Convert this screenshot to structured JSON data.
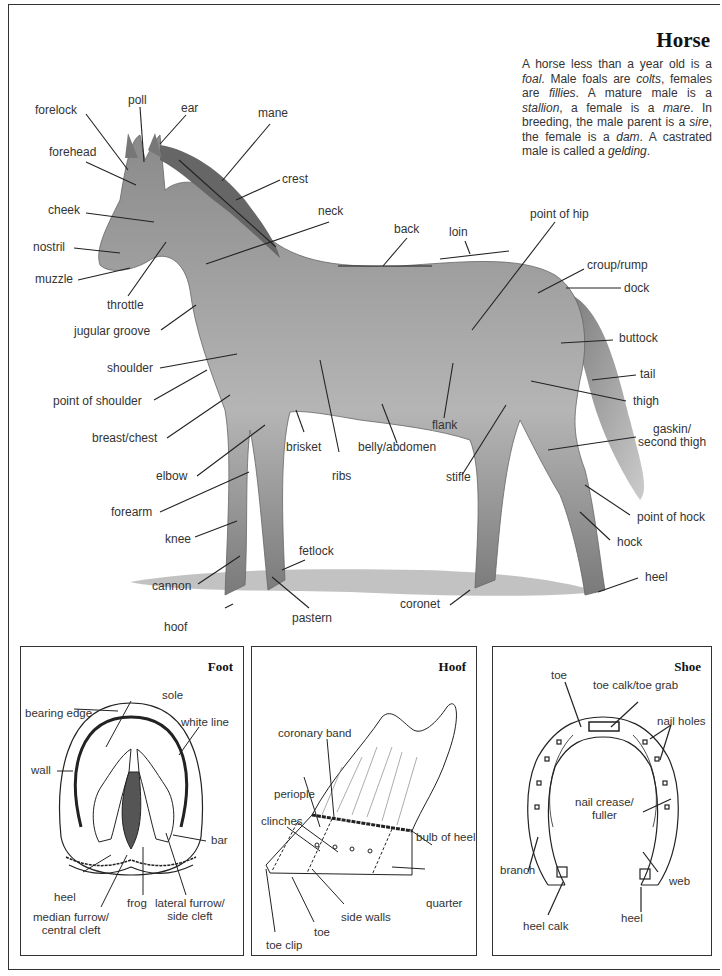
{
  "header": {
    "title": "Horse",
    "intro": [
      {
        "text": "A horse less than a year old is a "
      },
      {
        "text": "foal",
        "italic": true
      },
      {
        "text": ". Male foals are "
      },
      {
        "text": "colts",
        "italic": true
      },
      {
        "text": ", females are "
      },
      {
        "text": "fillies",
        "italic": true
      },
      {
        "text": ". A mature male is a "
      },
      {
        "text": "stallion",
        "italic": true
      },
      {
        "text": ", a female is a "
      },
      {
        "text": "mare",
        "italic": true
      },
      {
        "text": ". In breeding, the male parent is a "
      },
      {
        "text": "sire",
        "italic": true
      },
      {
        "text": ", the female is a "
      },
      {
        "text": "dam",
        "italic": true
      },
      {
        "text": ". A castrated male is called a "
      },
      {
        "text": "gelding",
        "italic": true
      },
      {
        "text": "."
      }
    ]
  },
  "horse_labels": {
    "poll": "poll",
    "forelock": "forelock",
    "ear": "ear",
    "mane": "mane",
    "forehead": "forehead",
    "crest": "crest",
    "cheek": "cheek",
    "neck": "neck",
    "nostril": "nostril",
    "muzzle": "muzzle",
    "throttle": "throttle",
    "jugular_groove": "jugular groove",
    "back": "back",
    "loin": "loin",
    "point_of_hip": "point of hip",
    "croup_rump": "croup/rump",
    "dock": "dock",
    "buttock": "buttock",
    "tail": "tail",
    "thigh": "thigh",
    "gaskin_1": "gaskin/",
    "gaskin_2": "second thigh",
    "shoulder": "shoulder",
    "point_of_shoulder": "point of shoulder",
    "breast_chest": "breast/chest",
    "elbow": "elbow",
    "brisket": "brisket",
    "ribs": "ribs",
    "belly_abdomen": "belly/abdomen",
    "flank": "flank",
    "stifle": "stifle",
    "forearm": "forearm",
    "knee": "knee",
    "fetlock": "fetlock",
    "cannon": "cannon",
    "pastern": "pastern",
    "hoof": "hoof",
    "coronet": "coronet",
    "point_of_hock": "point of hock",
    "hock": "hock",
    "heel": "heel"
  },
  "foot_panel": {
    "title": "Foot",
    "labels": {
      "sole": "sole",
      "bearing_edge": "bearing edge",
      "white_line": "white line",
      "wall": "wall",
      "bar": "bar",
      "heel": "heel",
      "frog": "frog",
      "median_furrow_1": "median furrow/",
      "median_furrow_2": "central cleft",
      "lateral_furrow_1": "lateral furrow/",
      "lateral_furrow_2": "side cleft"
    }
  },
  "hoof_panel": {
    "title": "Hoof",
    "labels": {
      "coronary_band": "coronary band",
      "periople": "periople",
      "clinches": "clinches",
      "bulb_of_heel": "bulb of heel",
      "quarter": "quarter",
      "side_walls": "side walls",
      "toe": "toe",
      "toe_clip": "toe clip"
    }
  },
  "shoe_panel": {
    "title": "Shoe",
    "labels": {
      "toe": "toe",
      "toe_calk": "toe calk/toe grab",
      "nail_holes": "nail holes",
      "nail_crease_1": "nail crease/",
      "nail_crease_2": "fuller",
      "branch": "branch",
      "web": "web",
      "heel": "heel",
      "heel_calk": "heel calk"
    }
  }
}
